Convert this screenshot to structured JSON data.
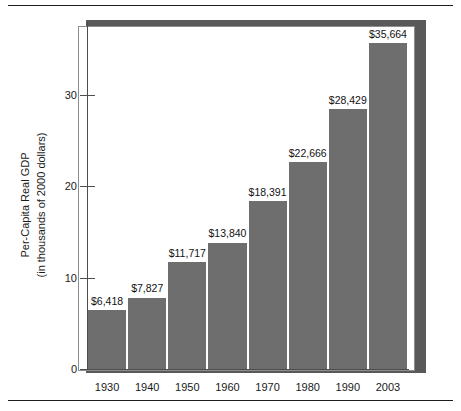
{
  "figure": {
    "frame_color": "#8d8d8d",
    "shadow_color": "#595959",
    "background": "#ffffff"
  },
  "chart_data": {
    "type": "bar",
    "title": "",
    "subtitle": "",
    "xlabel": "",
    "ylabel_line1": "Per-Capita Real GDP",
    "ylabel_line2": "(in thousands of 2000 dollars)",
    "categories": [
      "1930",
      "1940",
      "1950",
      "1960",
      "1970",
      "1980",
      "1990",
      "2003"
    ],
    "values": [
      6.418,
      7.827,
      11.717,
      13.84,
      18.391,
      22.666,
      28.429,
      35.664
    ],
    "data_labels": [
      "$6,418",
      "$7,827",
      "$11,717",
      "$13,840",
      "$18,391",
      "$22,666",
      "$28,429",
      "$35,664"
    ],
    "ylim": [
      0,
      38
    ],
    "yticks": [
      0,
      10,
      20,
      30
    ],
    "ytick_labels": [
      "0",
      "10",
      "20",
      "30"
    ],
    "grid": false,
    "legend": null,
    "bar_color": "#6e6e6e",
    "axis_color": "#4d4d4d",
    "label_color": "#111111"
  }
}
